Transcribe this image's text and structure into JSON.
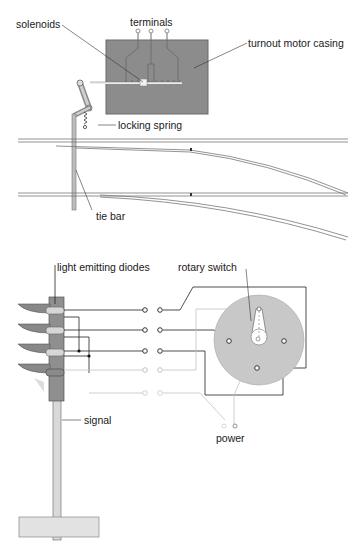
{
  "diagram": {
    "turnout": {
      "labels": {
        "solenoids": "solenoids",
        "terminals": "terminals",
        "casing": "turnout motor casing",
        "locking_spring": "locking spring",
        "tie_bar": "tie bar"
      }
    },
    "signal_circuit": {
      "labels": {
        "leds": "light emitting diodes",
        "rotary_switch": "rotary switch",
        "signal": "signal",
        "power": "power"
      }
    },
    "colors": {
      "casing": "#8a8a8a",
      "switch_disc": "#c6c6c6",
      "rail": "#7a7a7a",
      "wire": "#1a1a1a",
      "wire_light": "#bdbdbd"
    }
  }
}
